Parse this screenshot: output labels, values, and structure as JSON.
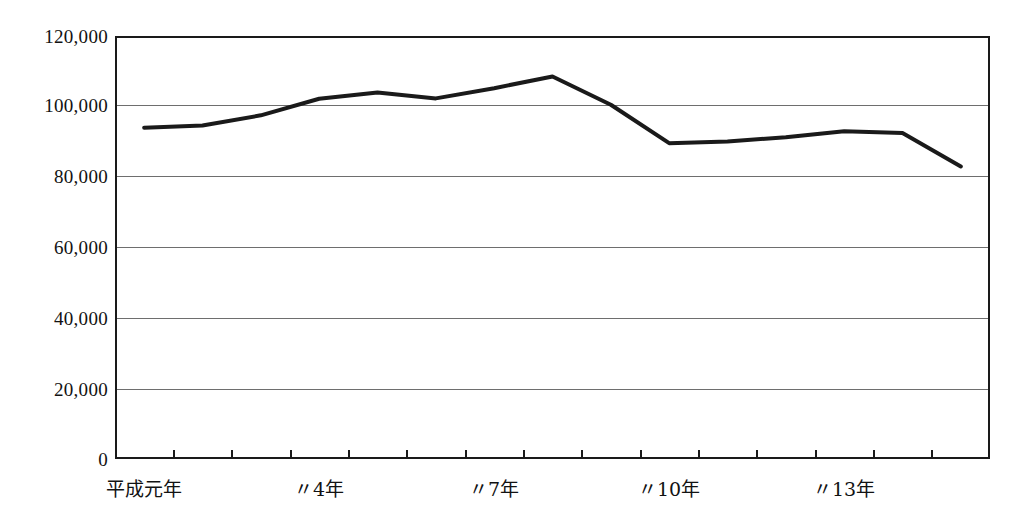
{
  "chart_data": {
    "type": "line",
    "title": "",
    "subtitle": "",
    "xlabel": "",
    "ylabel": "",
    "grid": true,
    "legend": "none",
    "ylim": [
      0,
      120000
    ],
    "y_ticks": [
      0,
      20000,
      40000,
      60000,
      80000,
      100000,
      120000
    ],
    "y_tick_labels": [
      "0",
      "20,000",
      "40,000",
      "60,000",
      "80,000",
      "100,000",
      "120,000"
    ],
    "categories": [
      "平成元年",
      "〃2年",
      "〃3年",
      "〃4年",
      "〃5年",
      "〃6年",
      "〃7年",
      "〃8年",
      "〃9年",
      "〃10年",
      "〃11年",
      "〃12年",
      "〃13年",
      "〃14年",
      "〃15年"
    ],
    "x_tick_labels": [
      {
        "index": 0,
        "label": "平成元年"
      },
      {
        "index": 3,
        "label": "〃4年"
      },
      {
        "index": 6,
        "label": "〃7年"
      },
      {
        "index": 9,
        "label": "〃10年"
      },
      {
        "index": 12,
        "label": "〃13年"
      }
    ],
    "series": [
      {
        "name": "件数",
        "color": "#1a1a1a",
        "values": [
          94000,
          94600,
          97500,
          102200,
          104000,
          102300,
          105200,
          108500,
          100500,
          89600,
          90100,
          91300,
          93000,
          92500,
          83000
        ]
      }
    ]
  },
  "style": {
    "line_color": "#1a1a1a",
    "grid_color": "#6e6e6e",
    "frame_color": "#1a1a1a",
    "background": "#ffffff"
  }
}
